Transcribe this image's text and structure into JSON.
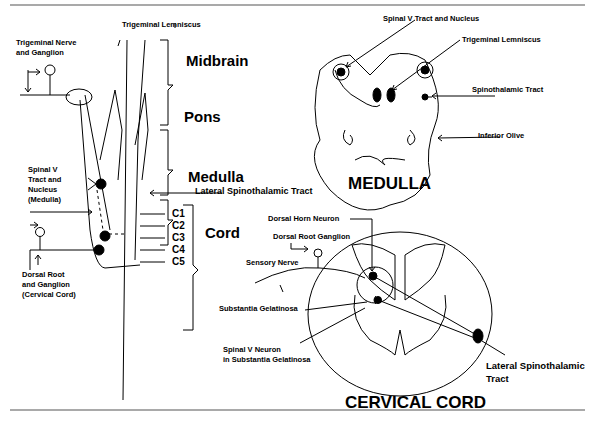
{
  "left_panel": {
    "trigeminal_lemniscus": "Trigeminal Lemniscus",
    "trigeminal_nerve": [
      "Trigeminal Nerve",
      "and Ganglion"
    ],
    "spinal_v": [
      "Spinal V",
      "Tract and",
      "Nucleus",
      "(Medulla)"
    ],
    "dorsal_root": [
      "Dorsal Root",
      "and Ganglion",
      "(Cervical Cord)"
    ],
    "regions": {
      "midbrain": "Midbrain",
      "pons": "Pons",
      "medulla": "Medulla",
      "cord": "Cord"
    },
    "segments": [
      "C1",
      "C2",
      "C3",
      "C4",
      "C5"
    ],
    "lateral_spinothalamic": "Lateral Spinothalamic Tract"
  },
  "medulla_panel": {
    "title": "MEDULLA",
    "labels": {
      "spinal_v": "Spinal V Tract and Nucleus",
      "trigeminal_lemniscus": "Trigeminal Lemniscus",
      "spinothalamic": "Spinothalamic Tract",
      "inferior_olive": "Inferior Olive"
    }
  },
  "cord_panel": {
    "title": "CERVICAL CORD",
    "labels": {
      "dorsal_horn": "Dorsal Horn Neuron",
      "dorsal_root_ganglion": "Dorsal Root Ganglion",
      "sensory_nerve": "Sensory Nerve",
      "substantia": "Substantia Gelatinosa",
      "spinal_v_neuron": [
        "Spinal V Neuron",
        "in Substantia Gelatinosa"
      ],
      "lateral_spinothalamic": [
        "Lateral Spinothalamic",
        "Tract"
      ]
    }
  }
}
